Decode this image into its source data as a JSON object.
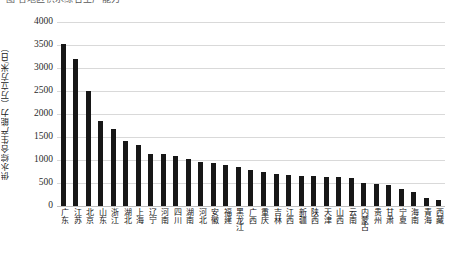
{
  "title_fragment": {
    "text": "图 各地区供水综合生产能力"
  },
  "axes": {
    "y_axis_title": "供水综合生产能力（万立方米/日）",
    "y_ticks": [
      "0",
      "500",
      "1000",
      "1500",
      "2000",
      "2500",
      "3000",
      "3500",
      "4000"
    ],
    "x_axis_title": ""
  },
  "style": {
    "bar_color": "#171717",
    "gridline_color": "#d9d9d9",
    "background": "#ffffff"
  },
  "chart_data": {
    "type": "bar",
    "title": "各地区供水综合生产能力",
    "xlabel": "",
    "ylabel": "供水综合生产能力（万立方米/日）",
    "ylim": [
      0,
      4000
    ],
    "ytick_step": 500,
    "grid": true,
    "legend": false,
    "orientation": "vertical",
    "categories": [
      "广东",
      "江苏",
      "北京",
      "山东",
      "浙江",
      "湖北",
      "上海",
      "辽宁",
      "河南",
      "四川",
      "湖南",
      "河北",
      "安徽",
      "福建",
      "黑龙江",
      "广西",
      "重庆",
      "吉林",
      "江西",
      "新疆",
      "陕西",
      "天津",
      "山西",
      "云南",
      "内蒙古",
      "贵州",
      "甘肃",
      "宁夏",
      "海南",
      "青海",
      "西藏"
    ],
    "values": [
      3520,
      3200,
      2500,
      1850,
      1680,
      1420,
      1330,
      1140,
      1120,
      1080,
      1030,
      960,
      940,
      900,
      850,
      790,
      740,
      700,
      680,
      660,
      650,
      640,
      620,
      610,
      500,
      480,
      460,
      360,
      300,
      170,
      120
    ]
  }
}
